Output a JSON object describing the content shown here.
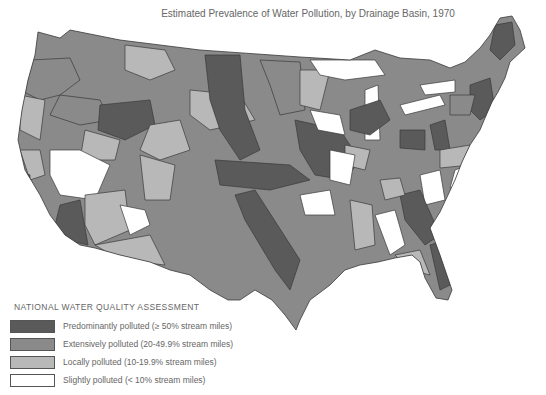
{
  "title": "Estimated Prevalence of Water Pollution, by Drainage Basin, 1970",
  "legend": {
    "title": "NATIONAL WATER QUALITY ASSESSMENT",
    "items": [
      {
        "label": "Predominantly polluted (≥ 50% stream miles)",
        "color": "#5a5a5a"
      },
      {
        "label": "Extensively polluted (20-49.9% stream miles)",
        "color": "#8a8a8a"
      },
      {
        "label": "Locally polluted (10-19.9% stream miles)",
        "color": "#b8b8b8"
      },
      {
        "label": "Slightly polluted (< 10% stream miles)",
        "color": "#ffffff"
      }
    ]
  },
  "colors": {
    "predominant": "#5a5a5a",
    "extensive": "#8a8a8a",
    "local": "#b8b8b8",
    "slight": "#ffffff",
    "border": "#3a3a3a"
  }
}
